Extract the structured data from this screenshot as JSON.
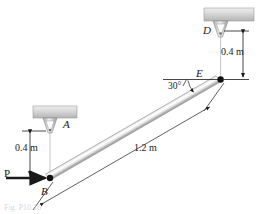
{
  "figure": {
    "background_color": "#ffffff",
    "caption": "Fig. P10.16"
  },
  "labels": {
    "point_a": "A",
    "point_b": "B",
    "point_d": "D",
    "point_e": "E",
    "force_p": "P"
  },
  "dimensions": {
    "left_vertical": "0.4 m",
    "right_vertical": "0.4 m",
    "bar_length": "1.2 m",
    "angle": "30°"
  },
  "colors": {
    "line": "#1a1a1a",
    "support_block_light": "#e4e4e4",
    "support_block_dark": "#b8b8b8",
    "bar_light": "#fdfdfd",
    "bar_mid": "#d6d6d6",
    "bar_dark": "#9a9a9a",
    "cable": "#8d8d8d",
    "node": "#111111"
  },
  "elements": {
    "support_a": "ceiling-support-block-a",
    "support_d": "ceiling-support-block-d",
    "cable_ab": "cable-a-to-b",
    "cable_de": "cable-d-to-e",
    "bar_be": "rigid-bar-b-to-e",
    "force_arrow": "applied-force-arrow-p",
    "node_b": "pin-node-b",
    "node_e": "pin-node-e"
  }
}
